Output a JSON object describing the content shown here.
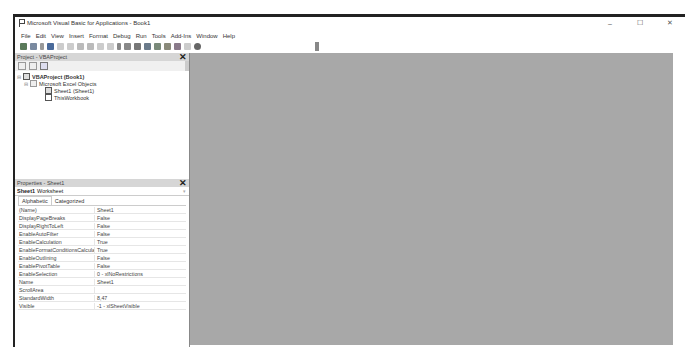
{
  "window": {
    "title": "Microsoft Visual Basic for Applications - Book1",
    "controls": {
      "minimize": "–",
      "maximize": "☐",
      "close": "✕"
    }
  },
  "menubar": {
    "items": [
      "File",
      "Edit",
      "View",
      "Insert",
      "Format",
      "Debug",
      "Run",
      "Tools",
      "Add-Ins",
      "Window",
      "Help"
    ]
  },
  "toolbar": {
    "buttons": [
      "view-excel-icon",
      "insert-userform-icon",
      "dropdown-icon",
      "save-icon",
      "cut-icon",
      "copy-icon",
      "paste-icon",
      "find-icon",
      "undo-icon",
      "redo-icon",
      "run-icon",
      "break-icon",
      "reset-icon",
      "design-mode-icon",
      "project-explorer-icon",
      "properties-window-icon",
      "object-browser-icon",
      "toolbox-icon",
      "help-icon"
    ]
  },
  "project_pane": {
    "title": "Project - VBAProject",
    "close": "✕",
    "tree": {
      "root": "VBAProject (Book1)",
      "folder": "Microsoft Excel Objects",
      "items": [
        "Sheet1 (Sheet1)",
        "ThisWorkbook"
      ]
    }
  },
  "properties_pane": {
    "title": "Properties - Sheet1",
    "close": "✕",
    "object_name": "Sheet1",
    "object_type": "Worksheet",
    "tabs": [
      "Alphabetic",
      "Categorized"
    ],
    "rows": [
      {
        "key": "(Name)",
        "value": "Sheet1"
      },
      {
        "key": "DisplayPageBreaks",
        "value": "False"
      },
      {
        "key": "DisplayRightToLeft",
        "value": "False"
      },
      {
        "key": "EnableAutoFilter",
        "value": "False"
      },
      {
        "key": "EnableCalculation",
        "value": "True"
      },
      {
        "key": "EnableFormatConditionsCalculation",
        "value": "True"
      },
      {
        "key": "EnableOutlining",
        "value": "False"
      },
      {
        "key": "EnablePivotTable",
        "value": "False"
      },
      {
        "key": "EnableSelection",
        "value": "0 - xlNoRestrictions"
      },
      {
        "key": "Name",
        "value": "Sheet1"
      },
      {
        "key": "ScrollArea",
        "value": ""
      },
      {
        "key": "StandardWidth",
        "value": "8,47"
      },
      {
        "key": "Visible",
        "value": "-1 - xlSheetVisible"
      }
    ]
  }
}
